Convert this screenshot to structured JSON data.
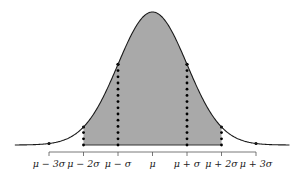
{
  "chart_data": {
    "type": "area",
    "title": "",
    "xlabel": "",
    "ylabel": "",
    "mean": 0,
    "sd": 1,
    "shaded_range": [
      -2,
      2
    ],
    "dotted_lines_at": [
      -2,
      -1,
      1,
      2
    ],
    "points_at": [
      -3,
      -2,
      -1,
      1,
      2,
      3
    ],
    "x_ticks": [
      -3,
      -2,
      -1,
      0,
      1,
      2,
      3
    ],
    "tick_labels": [
      "μ − 3σ",
      "μ − 2σ",
      "μ − σ",
      "μ",
      "μ + σ",
      "μ + 2σ",
      "μ + 3σ"
    ],
    "grid": false,
    "legend": null
  },
  "colors": {
    "fill": "#a9a9a9",
    "curve": "#1a1a1a",
    "axis": "#555555"
  }
}
